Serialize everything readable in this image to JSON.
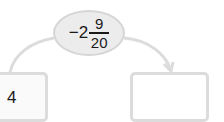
{
  "center_node": {
    "sign": "−",
    "whole": "2",
    "numerator": "9",
    "denominator": "20"
  },
  "left_box": {
    "value": "4"
  },
  "right_box": {
    "value": ""
  },
  "colors": {
    "line": "#dcdcdc",
    "oval_fill": "#ececec",
    "text": "#1a1a1a"
  }
}
